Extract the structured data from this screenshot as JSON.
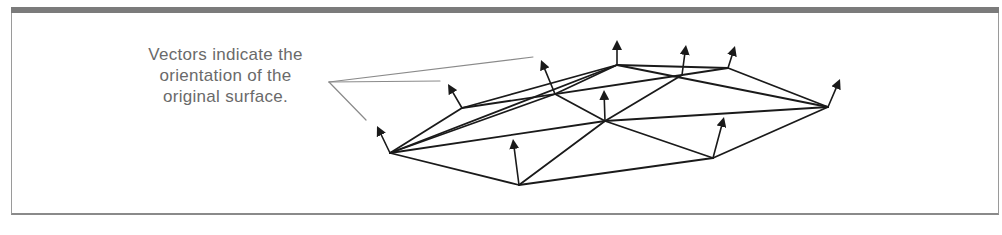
{
  "figure": {
    "caption_lines": [
      "Vectors indicate the",
      "orientation of the",
      "original surface."
    ],
    "colors": {
      "frame_bar": "#7b7b7b",
      "frame_border": "#9a9a9a",
      "caption_text": "#6a6a6a",
      "leader_line": "#8a8a8a",
      "mesh_line": "#1a1a1a"
    },
    "mesh": {
      "vertices": {
        "left": [
          390,
          153
        ],
        "bottom": [
          519,
          185
        ],
        "center": [
          605,
          121
        ],
        "bottom_right": [
          713,
          158
        ],
        "right": [
          828,
          107
        ],
        "upper_left": [
          462,
          108
        ],
        "upper_mid": [
          555,
          94
        ],
        "top": [
          617,
          65
        ],
        "top_mid": [
          682,
          75
        ],
        "top_right": [
          728,
          68
        ]
      },
      "edges": [
        [
          "left",
          "bottom"
        ],
        [
          "bottom",
          "bottom_right"
        ],
        [
          "bottom_right",
          "right"
        ],
        [
          "left",
          "upper_left"
        ],
        [
          "left",
          "upper_mid"
        ],
        [
          "left",
          "top"
        ],
        [
          "left",
          "center"
        ],
        [
          "bottom",
          "center"
        ],
        [
          "center",
          "bottom_right"
        ],
        [
          "center",
          "right"
        ],
        [
          "center",
          "upper_mid"
        ],
        [
          "center",
          "top_mid"
        ],
        [
          "upper_left",
          "top"
        ],
        [
          "upper_left",
          "top_mid"
        ],
        [
          "upper_mid",
          "top"
        ],
        [
          "top",
          "top_right"
        ],
        [
          "top",
          "right"
        ],
        [
          "top_mid",
          "top_right"
        ],
        [
          "top_right",
          "right"
        ]
      ],
      "normal_vectors": [
        {
          "from": [
            390,
            153
          ],
          "to": [
            377,
            126
          ]
        },
        {
          "from": [
            462,
            108
          ],
          "to": [
            448,
            84
          ]
        },
        {
          "from": [
            555,
            94
          ],
          "to": [
            541,
            60
          ]
        },
        {
          "from": [
            617,
            65
          ],
          "to": [
            617,
            40
          ]
        },
        {
          "from": [
            682,
            75
          ],
          "to": [
            686,
            45
          ]
        },
        {
          "from": [
            728,
            68
          ],
          "to": [
            735,
            46
          ]
        },
        {
          "from": [
            828,
            107
          ],
          "to": [
            840,
            79
          ]
        },
        {
          "from": [
            519,
            185
          ],
          "to": [
            513,
            139
          ]
        },
        {
          "from": [
            605,
            121
          ],
          "to": [
            604,
            90
          ]
        },
        {
          "from": [
            713,
            158
          ],
          "to": [
            724,
            117
          ]
        }
      ]
    },
    "leader_lines": [
      {
        "from": [
          329,
          82
        ],
        "to": [
          533,
          57
        ]
      },
      {
        "from": [
          329,
          82
        ],
        "to": [
          440,
          81
        ]
      },
      {
        "from": [
          329,
          82
        ],
        "to": [
          366,
          120
        ]
      }
    ]
  }
}
